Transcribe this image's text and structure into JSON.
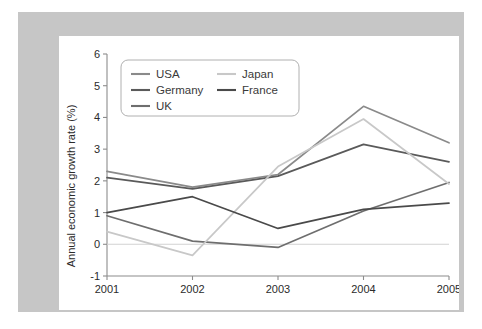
{
  "figure": {
    "frame_color": "#c6c6c6",
    "plot_background": "#ffffff"
  },
  "chart_data": {
    "type": "line",
    "title": "",
    "xlabel": "",
    "ylabel": "Annual economic growth rate (%)",
    "categories": [
      "2001",
      "2002",
      "2003",
      "2004",
      "2005"
    ],
    "x": [
      2001,
      2002,
      2003,
      2004,
      2005
    ],
    "ylim": [
      -1,
      6
    ],
    "yticks": [
      "-1",
      "0",
      "1",
      "2",
      "3",
      "4",
      "5",
      "6"
    ],
    "ytick_values": [
      -1,
      0,
      1,
      2,
      3,
      4,
      5,
      6
    ],
    "grid": false,
    "legend_position": "upper-left",
    "series": [
      {
        "name": "USA",
        "color": "#8a8a8a",
        "values": [
          2.3,
          1.8,
          2.2,
          4.35,
          3.2
        ]
      },
      {
        "name": "Germany",
        "color": "#5a5a5a",
        "values": [
          2.1,
          1.75,
          2.15,
          3.15,
          2.6
        ]
      },
      {
        "name": "UK",
        "color": "#6e6e6e",
        "values": [
          0.9,
          0.1,
          -0.1,
          1.05,
          1.95
        ]
      },
      {
        "name": "Japan",
        "color": "#c8c8c8",
        "values": [
          0.4,
          -0.35,
          2.45,
          3.95,
          1.9
        ]
      },
      {
        "name": "France",
        "color": "#4a4a4a",
        "values": [
          1.0,
          1.5,
          0.5,
          1.1,
          1.3
        ]
      }
    ]
  },
  "legend": {
    "entries": [
      {
        "label": "USA",
        "color": "#8a8a8a"
      },
      {
        "label": "Germany",
        "color": "#5a5a5a"
      },
      {
        "label": "UK",
        "color": "#6e6e6e"
      },
      {
        "label": "Japan",
        "color": "#c8c8c8"
      },
      {
        "label": "France",
        "color": "#4a4a4a"
      }
    ]
  }
}
